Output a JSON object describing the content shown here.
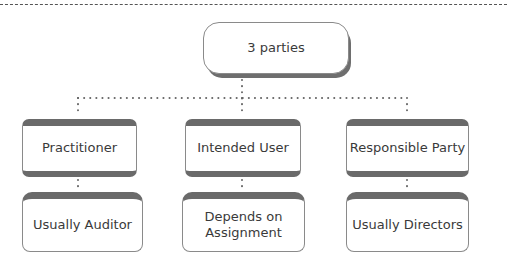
{
  "diagram": {
    "type": "hierarchy",
    "root": {
      "label": "3 parties"
    },
    "parties": [
      {
        "role": "Practitioner",
        "who": "Usually Auditor"
      },
      {
        "role": "Intended User",
        "who": "Depends on Assignment"
      },
      {
        "role": "Responsible Party",
        "who": "Usually Directors"
      }
    ],
    "colors": {
      "box_border": "#8a8a8a",
      "box_band": "#6a6a6a",
      "text": "#3a3a3a",
      "connector": "#666666"
    }
  }
}
